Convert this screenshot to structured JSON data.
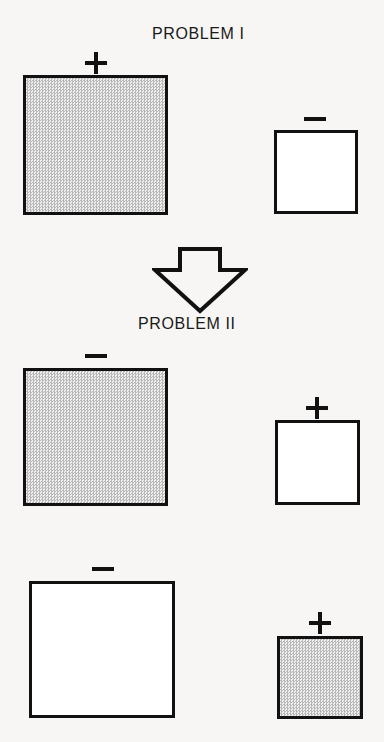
{
  "figure": {
    "background_color": "#f7f6f4",
    "ink_color": "#111111",
    "fill_gray": "#d6d6d6",
    "width": 384,
    "height": 742
  },
  "captions": [
    {
      "id": "problem-1",
      "text": "PROBLEM I",
      "x": 152,
      "y": 25
    },
    {
      "id": "problem-2",
      "text": "PROBLEM II",
      "x": 138,
      "y": 315
    }
  ],
  "arrow": {
    "name": "down-arrow",
    "x": 152,
    "y": 246,
    "width": 96,
    "height": 68,
    "direction": "down",
    "style": "outlined"
  },
  "rows": [
    {
      "id": "row-1",
      "problem": "PROBLEM I",
      "items": [
        {
          "id": "r1-large",
          "sign": "+",
          "size": "large",
          "fill": "gray",
          "x": 23,
          "y": 75,
          "w": 145,
          "h": 140,
          "sign_x": 85,
          "sign_y": 52,
          "sign_w": 22,
          "sign_h": 22
        },
        {
          "id": "r1-small",
          "sign": "-",
          "size": "small",
          "fill": "white",
          "x": 274,
          "y": 130,
          "w": 84,
          "h": 84,
          "sign_x": 304,
          "sign_y": 108,
          "sign_w": 22,
          "sign_h": 22
        }
      ]
    },
    {
      "id": "row-2",
      "problem": "PROBLEM II",
      "items": [
        {
          "id": "r2-large",
          "sign": "-",
          "size": "large",
          "fill": "gray",
          "x": 23,
          "y": 368,
          "w": 145,
          "h": 138,
          "sign_x": 85,
          "sign_y": 345,
          "sign_w": 22,
          "sign_h": 22
        },
        {
          "id": "r2-small",
          "sign": "+",
          "size": "small",
          "fill": "white",
          "x": 275,
          "y": 420,
          "w": 85,
          "h": 85,
          "sign_x": 306,
          "sign_y": 397,
          "sign_w": 22,
          "sign_h": 22
        }
      ]
    },
    {
      "id": "row-3",
      "problem": "PROBLEM II",
      "items": [
        {
          "id": "r3-large",
          "sign": "-",
          "size": "large",
          "fill": "white",
          "x": 29,
          "y": 581,
          "w": 146,
          "h": 137,
          "sign_x": 92,
          "sign_y": 558,
          "sign_w": 22,
          "sign_h": 22
        },
        {
          "id": "r3-small",
          "sign": "+",
          "size": "small",
          "fill": "gray",
          "x": 277,
          "y": 636,
          "w": 86,
          "h": 83,
          "sign_x": 309,
          "sign_y": 612,
          "sign_w": 22,
          "sign_h": 22
        }
      ]
    }
  ]
}
